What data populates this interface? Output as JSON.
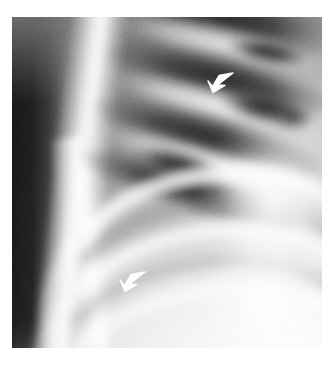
{
  "figure": {
    "modality": "radiograph",
    "view_label": "chest-radiograph-coned-down",
    "plate": {
      "x": 12,
      "y": 17,
      "width": 310,
      "height": 331,
      "background_color": "#ffffff",
      "tone_dark": "#141414",
      "tone_mid": "#8d8d8d",
      "tone_bright": "#ffffff"
    },
    "regions": [
      {
        "name": "air-background-stripe",
        "description": "dark vertical band at far left outside the body"
      },
      {
        "name": "scapula-chest-wall-edge",
        "description": "bright near-vertical bone band left of centre"
      },
      {
        "name": "posterior-rib-bands-upper",
        "description": "diagonal alternating dark and bright rib bands in the upper lung zone"
      },
      {
        "name": "anterior-rib-arcs-lower",
        "description": "bright curved rib arcs across the lower half"
      },
      {
        "name": "lateral-chest-wall-right",
        "description": "bright soft tissue along the right margin"
      }
    ],
    "markers": [
      {
        "id": "upper-arrow",
        "shape": "open-arrowhead",
        "color": "#ffffff",
        "direction": "down-left",
        "x": 190,
        "y": 52
      },
      {
        "id": "lower-arrow",
        "shape": "open-arrowhead",
        "color": "#ffffff",
        "direction": "down-left",
        "x": 102,
        "y": 251
      }
    ]
  },
  "caption": {
    "text": "",
    "visible": false
  }
}
